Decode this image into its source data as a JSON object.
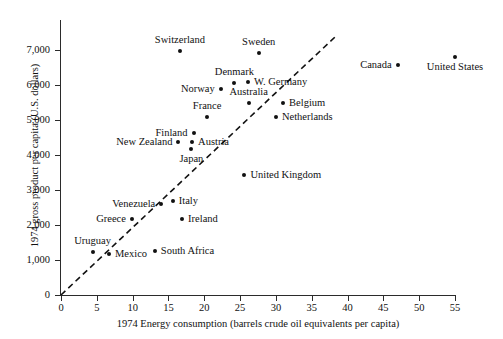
{
  "chart_data": {
    "type": "scatter",
    "title": "",
    "xlabel": "1974 Energy consumption (barrels crude oil equivalents per capita)",
    "ylabel": "1974 gross product per capita (U.S. dollars)",
    "xlim": [
      0,
      55
    ],
    "ylim": [
      0,
      7400
    ],
    "grid": false,
    "legend": "none",
    "xticks": [
      0,
      5,
      10,
      15,
      20,
      25,
      30,
      35,
      40,
      45,
      50,
      55
    ],
    "xtick_labels": [
      "0",
      "5",
      "10",
      "15",
      "20",
      "25",
      "30",
      "35",
      "40",
      "45",
      "50",
      "55"
    ],
    "yticks": [
      0,
      1000,
      2000,
      3000,
      4000,
      5000,
      6000,
      7000
    ],
    "ytick_labels": [
      "0",
      "1,000",
      "2,000",
      "3,000",
      "4,000",
      "5,000",
      "6,000",
      "7,000"
    ],
    "annotations": [
      {
        "name": "reference-line",
        "style": "dashed",
        "description": "dashed line of proportionality through origin",
        "x0": 0,
        "y0": 0,
        "x1": 38.4,
        "y1": 7400
      }
    ],
    "points": [
      {
        "label": "Switzerland",
        "x": 16.6,
        "y": 6980,
        "label_pos": "above"
      },
      {
        "label": "Sweden",
        "x": 27.6,
        "y": 6920,
        "label_pos": "above"
      },
      {
        "label": "Canada",
        "x": 47.0,
        "y": 6560,
        "label_pos": "left"
      },
      {
        "label": "United States",
        "x": 55.0,
        "y": 6790,
        "label_pos": "below"
      },
      {
        "label": "Denmark",
        "x": 24.2,
        "y": 6060,
        "label_pos": "above"
      },
      {
        "label": "W. Germany",
        "x": 26.1,
        "y": 6080,
        "label_pos": "right"
      },
      {
        "label": "Norway",
        "x": 22.3,
        "y": 5900,
        "label_pos": "left"
      },
      {
        "label": "Australia",
        "x": 26.2,
        "y": 5500,
        "label_pos": "above"
      },
      {
        "label": "Belgium",
        "x": 31.0,
        "y": 5480,
        "label_pos": "right"
      },
      {
        "label": "France",
        "x": 20.4,
        "y": 5080,
        "label_pos": "above"
      },
      {
        "label": "Netherlands",
        "x": 30.0,
        "y": 5100,
        "label_pos": "right"
      },
      {
        "label": "Finland",
        "x": 18.5,
        "y": 4620,
        "label_pos": "left"
      },
      {
        "label": "New Zealand",
        "x": 16.4,
        "y": 4380,
        "label_pos": "left"
      },
      {
        "label": "Austria",
        "x": 18.3,
        "y": 4380,
        "label_pos": "right"
      },
      {
        "label": "Japan",
        "x": 18.2,
        "y": 4160,
        "label_pos": "below"
      },
      {
        "label": "United Kingdom",
        "x": 25.6,
        "y": 3420,
        "label_pos": "right"
      },
      {
        "label": "Venezuela",
        "x": 14.0,
        "y": 2600,
        "label_pos": "left"
      },
      {
        "label": "Italy",
        "x": 15.6,
        "y": 2680,
        "label_pos": "right"
      },
      {
        "label": "Greece",
        "x": 9.9,
        "y": 2180,
        "label_pos": "left"
      },
      {
        "label": "Ireland",
        "x": 16.9,
        "y": 2180,
        "label_pos": "right"
      },
      {
        "label": "Uruguay",
        "x": 4.4,
        "y": 1220,
        "label_pos": "above"
      },
      {
        "label": "Mexico",
        "x": 6.7,
        "y": 1180,
        "label_pos": "right"
      },
      {
        "label": "South Africa",
        "x": 13.1,
        "y": 1250,
        "label_pos": "right"
      }
    ]
  }
}
